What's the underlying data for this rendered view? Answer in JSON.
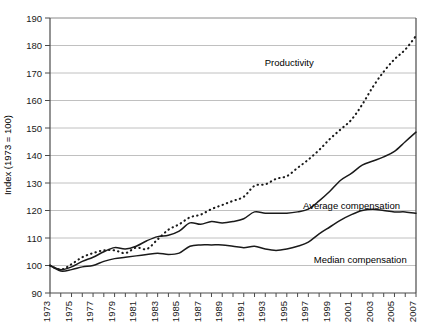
{
  "chart_data": {
    "type": "line",
    "title": "",
    "xlabel": "",
    "ylabel": "Index (1973 = 100)",
    "xlim": [
      1973,
      2007
    ],
    "ylim": [
      90,
      190
    ],
    "ytick_step": 10,
    "grid": true,
    "legend_position": "inline-annotations",
    "yticks": [
      90,
      100,
      110,
      120,
      130,
      140,
      150,
      160,
      170,
      180,
      190
    ],
    "xticks": [
      1973,
      1975,
      1977,
      1979,
      1981,
      1983,
      1985,
      1987,
      1989,
      1991,
      1993,
      1995,
      1997,
      1999,
      2001,
      2003,
      2005,
      2007
    ],
    "xticks_all": [
      1973,
      1974,
      1975,
      1976,
      1977,
      1978,
      1979,
      1980,
      1981,
      1982,
      1983,
      1984,
      1985,
      1986,
      1987,
      1988,
      1989,
      1990,
      1991,
      1992,
      1993,
      1994,
      1995,
      1996,
      1997,
      1998,
      1999,
      2000,
      2001,
      2002,
      2003,
      2004,
      2005,
      2006,
      2007
    ],
    "x": [
      1973,
      1974,
      1975,
      1976,
      1977,
      1978,
      1979,
      1980,
      1981,
      1982,
      1983,
      1984,
      1985,
      1986,
      1987,
      1988,
      1989,
      1990,
      1991,
      1992,
      1993,
      1994,
      1995,
      1996,
      1997,
      1998,
      1999,
      2000,
      2001,
      2002,
      2003,
      2004,
      2005,
      2006,
      2007
    ],
    "series": [
      {
        "name": "Productivity",
        "style": "dotted",
        "color": "#1a1a1a",
        "label_x": 1997.5,
        "label_y": 172.5,
        "values": [
          100,
          98.5,
          100.5,
          103,
          104.5,
          105.5,
          105.5,
          104.5,
          106.5,
          106,
          109.5,
          113,
          115,
          117.5,
          118.5,
          120.5,
          122,
          123.5,
          125,
          129,
          129.5,
          131.5,
          132.5,
          135.5,
          138.5,
          142,
          146,
          149.5,
          153,
          158.5,
          165,
          170.5,
          175,
          178.5,
          183.5
        ]
      },
      {
        "name": "Average compensation",
        "style": "solid",
        "color": "#1a1a1a",
        "label_x": 1996.5,
        "label_y": 120.5,
        "values": [
          100,
          98.5,
          99.5,
          101.5,
          103,
          105,
          106.5,
          106,
          107,
          109,
          110.5,
          111,
          112.5,
          115.5,
          115,
          116,
          115.5,
          116,
          117,
          119.5,
          119,
          119,
          119,
          119.5,
          120.5,
          123.5,
          127,
          131,
          133.5,
          136.5,
          138,
          139.5,
          141.5,
          145,
          148.5
        ]
      },
      {
        "name": "Median compensation",
        "style": "solid",
        "color": "#1a1a1a",
        "label_x": 1997.5,
        "label_y": 101,
        "values": [
          100,
          98,
          98.5,
          99.5,
          100,
          101.5,
          102.5,
          103,
          103.5,
          104,
          104.5,
          104,
          104.5,
          107,
          107.5,
          107.5,
          107.5,
          107,
          106.5,
          107,
          106,
          105.5,
          106,
          107,
          108.5,
          111.5,
          114,
          116.5,
          118.5,
          120,
          120.5,
          120,
          119.5,
          119.5,
          119
        ]
      }
    ]
  },
  "axis": {
    "y_title": "Index (1973 = 100)"
  }
}
